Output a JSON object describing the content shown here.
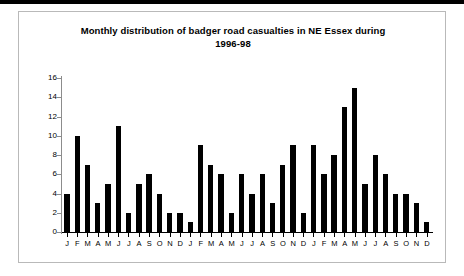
{
  "page": {
    "top_rule_color": "#000000",
    "panel_border_color": "#b9b9b9",
    "background": "#ffffff"
  },
  "chart_data": {
    "type": "bar",
    "title": "Monthly distribution of badger road casualties in NE Essex during 1996-98",
    "title_line1": "Monthly distribution of badger road casualties in NE Essex during",
    "title_line2": "1996-98",
    "xlabel": "",
    "ylabel": "",
    "ylim": [
      0,
      16
    ],
    "ytick_labels": [
      "16",
      "14",
      "12",
      "10",
      "8",
      "6",
      "4",
      "2",
      "0"
    ],
    "ytick_values": [
      16,
      14,
      12,
      10,
      8,
      6,
      4,
      2,
      0
    ],
    "grid": false,
    "legend": false,
    "bar_color": "#000000",
    "axis_color": "#000000",
    "categories": [
      "J",
      "F",
      "M",
      "A",
      "M",
      "J",
      "J",
      "A",
      "S",
      "O",
      "N",
      "D",
      "J",
      "F",
      "M",
      "A",
      "M",
      "J",
      "J",
      "A",
      "S",
      "O",
      "N",
      "D",
      "J",
      "F",
      "M",
      "A",
      "M",
      "J",
      "J",
      "A",
      "S",
      "O",
      "N",
      "D"
    ],
    "values": [
      4,
      10,
      7,
      3,
      5,
      11,
      2,
      5,
      6,
      4,
      2,
      2,
      1,
      9,
      7,
      6,
      2,
      6,
      4,
      6,
      3,
      7,
      9,
      2,
      9,
      6,
      8,
      13,
      15,
      5,
      8,
      6,
      4,
      4,
      3,
      1
    ],
    "series": [
      {
        "name": "Badger road casualties",
        "values": [
          4,
          10,
          7,
          3,
          5,
          11,
          2,
          5,
          6,
          4,
          2,
          2,
          1,
          9,
          7,
          6,
          2,
          6,
          4,
          6,
          3,
          7,
          9,
          2,
          9,
          6,
          8,
          13,
          15,
          5,
          8,
          6,
          4,
          4,
          3,
          1
        ]
      }
    ]
  }
}
